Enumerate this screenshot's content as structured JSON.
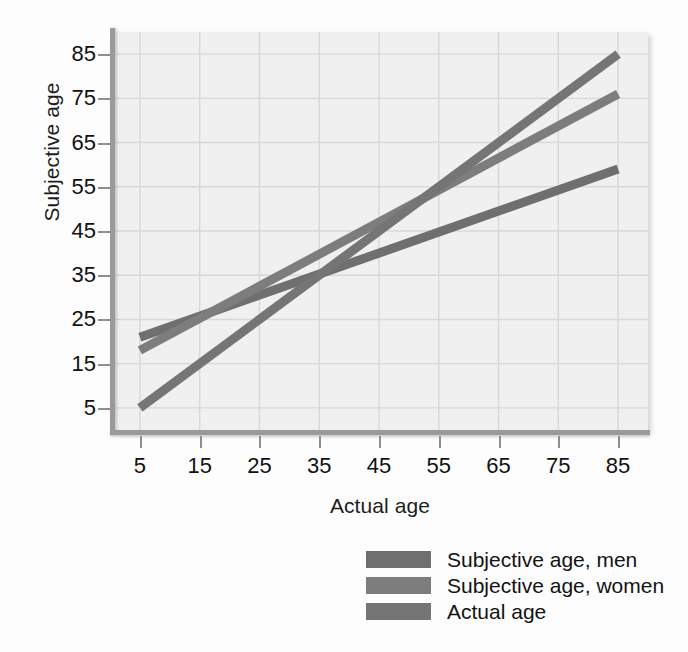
{
  "chart_data": {
    "type": "line",
    "title": "",
    "xlabel": "Actual age",
    "ylabel": "Subjective age",
    "xlim": [
      0,
      90
    ],
    "ylim": [
      0,
      90
    ],
    "xticks": [
      5,
      15,
      25,
      35,
      45,
      55,
      65,
      75,
      85
    ],
    "yticks": [
      5,
      15,
      25,
      35,
      45,
      55,
      65,
      75,
      85
    ],
    "grid": true,
    "legend_position": "below-right",
    "x": [
      5,
      85
    ],
    "series": [
      {
        "name": "Subjective age, men",
        "values": [
          21,
          59
        ],
        "color": "#6f6f6f",
        "endpoints": [
          [
            5,
            21
          ],
          [
            85,
            59
          ]
        ]
      },
      {
        "name": "Subjective age, women",
        "values": [
          18,
          76
        ],
        "color": "#7d7d7d",
        "endpoints": [
          [
            5,
            18
          ],
          [
            85,
            76
          ]
        ]
      },
      {
        "name": "Actual age",
        "values": [
          5,
          85
        ],
        "color": "#757575",
        "endpoints": [
          [
            5,
            5
          ],
          [
            85,
            85
          ]
        ]
      }
    ]
  },
  "axes": {
    "y_title": "Subjective age",
    "x_title": "Actual age",
    "y_tick_labels": [
      "85",
      "75",
      "65",
      "55",
      "45",
      "35",
      "25",
      "15",
      "5"
    ],
    "x_tick_labels": [
      "5",
      "15",
      "25",
      "35",
      "45",
      "55",
      "65",
      "75",
      "85"
    ]
  },
  "legend": {
    "items": [
      {
        "label": "Subjective age, men",
        "color": "#6f6f6f"
      },
      {
        "label": "Subjective age, women",
        "color": "#7d7d7d"
      },
      {
        "label": "Actual age",
        "color": "#757575"
      }
    ]
  },
  "colors": {
    "plot_background": "#f0f0f0",
    "page_background": "#fdfdfd",
    "grid": "#d8d8d8",
    "axis": "#9a9a9a",
    "text": "#111111"
  }
}
